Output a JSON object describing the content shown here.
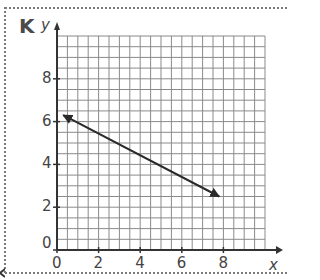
{
  "panel": {
    "label": "K"
  },
  "chart_data": {
    "type": "line",
    "title": "",
    "xlabel": "x",
    "ylabel": "y",
    "xlim": [
      0,
      10
    ],
    "ylim": [
      0,
      10
    ],
    "grid": true,
    "grid_step": 0.5,
    "x_ticks": [
      "0",
      "2",
      "4",
      "6",
      "8"
    ],
    "y_ticks": [
      "0",
      "2",
      "4",
      "6",
      "8"
    ],
    "series": [
      {
        "name": "line",
        "style": "line with arrows at both ends",
        "points": [
          {
            "x": 0.3,
            "y": 6.3
          },
          {
            "x": 7.8,
            "y": 2.5
          }
        ]
      }
    ]
  },
  "colors": {
    "grid": "#8a8a8a",
    "axis": "#333333",
    "line": "#2a2a2a",
    "frame": "#7a7a7a"
  }
}
